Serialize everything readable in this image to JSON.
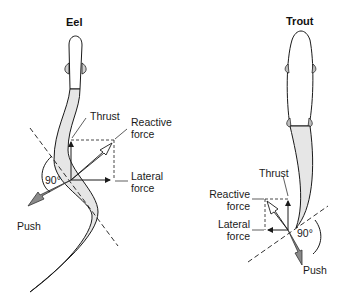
{
  "eel": {
    "title": "Eel",
    "labels": {
      "thrust": "Thrust",
      "reactive_1": "Reactive",
      "reactive_2": "force",
      "lateral_1": "Lateral",
      "lateral_2": "force",
      "angle": "90°",
      "push": "Push"
    }
  },
  "trout": {
    "title": "Trout",
    "labels": {
      "thrust": "Thrust",
      "reactive_1": "Reactive",
      "reactive_2": "force",
      "lateral_1": "Lateral",
      "lateral_2": "force",
      "angle": "90°",
      "push": "Push"
    }
  },
  "colors": {
    "body_fill": "#e6e6e6",
    "outline": "#1a1a1a",
    "push_arrow": "#8a8a8a"
  }
}
